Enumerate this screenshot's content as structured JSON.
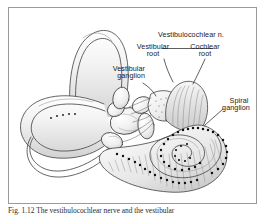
{
  "figure": {
    "frame_border_color": "#9a9a9a",
    "background_color": "#ffffff",
    "ink_color": "#3a3a3a",
    "label_color": "#1a1a1a",
    "labels": [
      {
        "id": "vestibulocochlear-nerve",
        "text": "Vestibulocochlear n.",
        "x": 148,
        "y": 37
      },
      {
        "id": "vestibular-root",
        "text": "Vestibular",
        "x": 138,
        "y": 49
      },
      {
        "id": "vestibular-root-2",
        "text": "root",
        "x": 151,
        "y": 56
      },
      {
        "id": "cochlear-root",
        "text": "Cochlear",
        "x": 190,
        "y": 49
      },
      {
        "id": "cochlear-root-2",
        "text": "root",
        "x": 201,
        "y": 56
      },
      {
        "id": "vestibular-ganglion",
        "text": "Vestibular",
        "x": 110,
        "y": 71
      },
      {
        "id": "vestibular-ganglion-2",
        "text": "ganglion",
        "x": 114,
        "y": 78
      },
      {
        "id": "spiral-ganglion",
        "text": "Spiral",
        "x": 228,
        "y": 103
      },
      {
        "id": "spiral-ganglion-2",
        "text": "ganglion",
        "x": 218,
        "y": 110
      }
    ],
    "caption": "Fig. 1.12  The vestibulocochlear nerve and the vestibular"
  }
}
